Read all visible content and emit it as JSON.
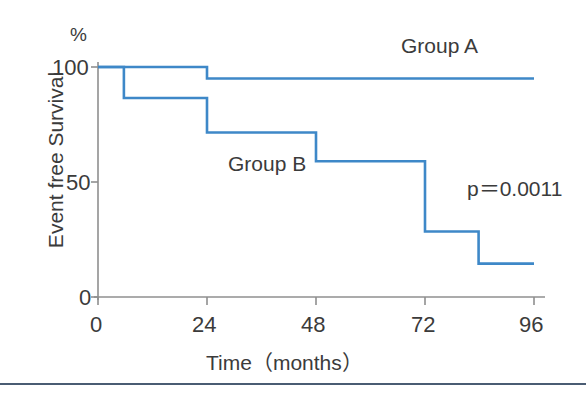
{
  "chart_data": {
    "type": "line",
    "subtype": "kaplan-meier-step",
    "title": "",
    "xlabel": "Time（months）",
    "ylabel": "Event free Survival",
    "yunit_label": "%",
    "xlim": [
      0,
      96
    ],
    "ylim": [
      0,
      100
    ],
    "xticks": [
      0,
      24,
      48,
      72,
      96
    ],
    "xtick_labels": [
      "0",
      "24",
      "48",
      "72",
      "96"
    ],
    "yticks": [
      0,
      50,
      100
    ],
    "ytick_labels": [
      "0",
      "50",
      "100"
    ],
    "grid": false,
    "legend_position": "inline-annotation",
    "line_color": "#3e88c8",
    "axis_color": "#8a8a8a",
    "series": [
      {
        "name": "Group A",
        "label": "Group A",
        "color": "#3e88c8",
        "steps": [
          {
            "x": 0,
            "y": 100
          },
          {
            "x": 24,
            "y": 100
          },
          {
            "x": 24,
            "y": 95
          },
          {
            "x": 96,
            "y": 95
          }
        ]
      },
      {
        "name": "Group B",
        "label": "Group B",
        "color": "#3e88c8",
        "steps": [
          {
            "x": 0,
            "y": 100
          },
          {
            "x": 5.7,
            "y": 100
          },
          {
            "x": 5.7,
            "y": 86.5
          },
          {
            "x": 24,
            "y": 86.5
          },
          {
            "x": 24,
            "y": 71.5
          },
          {
            "x": 48,
            "y": 71.5
          },
          {
            "x": 48,
            "y": 59
          },
          {
            "x": 72,
            "y": 59
          },
          {
            "x": 72,
            "y": 28.5
          },
          {
            "x": 83.8,
            "y": 28.5
          },
          {
            "x": 83.8,
            "y": 14.5
          },
          {
            "x": 96,
            "y": 14.5
          }
        ]
      }
    ],
    "annotations": [
      {
        "name": "p-value",
        "text": "p＝0.0011",
        "x": 88,
        "y": 45
      }
    ]
  },
  "axes": {
    "y_unit": "%",
    "y_ticks": [
      "100",
      "50",
      "0"
    ],
    "x_ticks": [
      "0",
      "24",
      "48",
      "72",
      "96"
    ],
    "x_title": "Time（months）",
    "y_title": "Event free Survival"
  },
  "labels": {
    "group_a": "Group A",
    "group_b": "Group B",
    "pvalue": "p＝0.0011"
  }
}
